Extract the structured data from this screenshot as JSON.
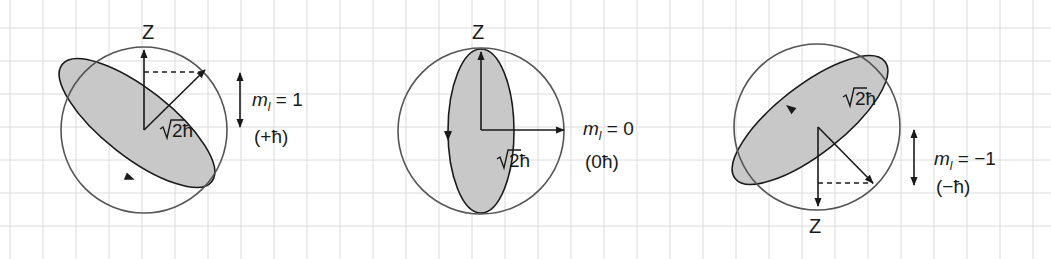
{
  "canvas": {
    "width": 1051,
    "height": 259,
    "background": "#ffffff"
  },
  "colors": {
    "grid": "#dcdcdc",
    "stroke": "#1a1a1a",
    "circle": "#555555",
    "ellipse_fill": "#c8c8c8"
  },
  "grid": {
    "x0": 10,
    "y0": 28,
    "spacing": 33
  },
  "figures": [
    {
      "id": "ml-plus-1",
      "center": [
        144,
        130
      ],
      "radius": 83,
      "ellipse": {
        "rx": 95,
        "ry": 34,
        "rotate": 38,
        "cx": 137,
        "cy": 123
      },
      "z_axis": {
        "from": [
          144,
          130
        ],
        "to": [
          144,
          50
        ],
        "label": "Z",
        "label_pos": [
          148,
          39
        ]
      },
      "vector": {
        "from": [
          144,
          130
        ],
        "to": [
          205,
          70
        ]
      },
      "dashed": {
        "from": [
          144,
          72
        ],
        "to": [
          205,
          72
        ]
      },
      "vector_label": {
        "text": "2ħ",
        "pos": [
          160,
          137
        ]
      },
      "double_arrow": {
        "x": 240,
        "y1": 73,
        "y2": 127
      },
      "ml_label": {
        "m": "m",
        "sub": "l",
        "rest": " = 1",
        "pos": [
          252,
          106
        ]
      },
      "hbar_label": {
        "text": "(+ħ)",
        "pos": [
          254,
          143
        ]
      },
      "loop_arrow": {
        "pos": [
          130,
          178
        ],
        "angle": 22
      }
    },
    {
      "id": "ml-zero",
      "center": [
        481,
        131
      ],
      "radius": 83,
      "ellipse": {
        "rx": 33,
        "ry": 82,
        "rotate": 0,
        "cx": 481,
        "cy": 131
      },
      "z_axis": {
        "from": [
          481,
          130
        ],
        "to": [
          481,
          52
        ],
        "label": "Z",
        "label_pos": [
          478,
          39
        ]
      },
      "vector": {
        "from": [
          481,
          130
        ],
        "to": [
          564,
          130
        ]
      },
      "dashed": null,
      "vector_label": {
        "text": "2ħ",
        "pos": [
          497,
          167
        ]
      },
      "double_arrow": null,
      "ml_label": {
        "m": "m",
        "sub": "l",
        "rest": " = 0",
        "pos": [
          583,
          135
        ]
      },
      "hbar_label": {
        "text": "(0ħ)",
        "pos": [
          585,
          168
        ]
      },
      "loop_arrow": {
        "pos": [
          448,
          136
        ],
        "angle": 90
      }
    },
    {
      "id": "ml-minus-1",
      "center": [
        817,
        127
      ],
      "radius": 83,
      "ellipse": {
        "rx": 95,
        "ry": 34,
        "rotate": -38,
        "cx": 810,
        "cy": 120
      },
      "z_axis": {
        "from": [
          818,
          127
        ],
        "to": [
          818,
          206
        ],
        "label": "Z",
        "label_pos": [
          815,
          233
        ]
      },
      "vector": {
        "from": [
          818,
          127
        ],
        "to": [
          873,
          183
        ]
      },
      "dashed": {
        "from": [
          818,
          183
        ],
        "to": [
          873,
          183
        ]
      },
      "vector_label": {
        "text": "2ħ",
        "pos": [
          843,
          105
        ]
      },
      "double_arrow": {
        "x": 914,
        "y1": 130,
        "y2": 185
      },
      "ml_label": {
        "m": "m",
        "sub": "l",
        "rest": " = −1",
        "pos": [
          934,
          165
        ]
      },
      "hbar_label": {
        "text": "(−ħ)",
        "pos": [
          936,
          193
        ]
      },
      "loop_arrow": {
        "pos": [
          790,
          108
        ],
        "angle": 218
      }
    }
  ]
}
